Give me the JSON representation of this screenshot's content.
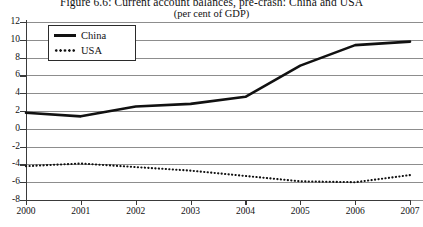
{
  "figure": {
    "title": "Figure 6.6: Current account balances, pre-crash: China and USA",
    "subtitle": "(per cent of GDP)"
  },
  "legend": {
    "items": [
      {
        "label": "China",
        "style": "solid",
        "color": "#111111",
        "swatch_icon": "solid-line-swatch"
      },
      {
        "label": "USA",
        "style": "dotted",
        "color": "#111111",
        "swatch_icon": "dotted-line-swatch"
      }
    ]
  },
  "axes": {
    "y_ticks": [
      "12",
      "10",
      "8",
      "6",
      "4",
      "2",
      "0",
      "-2",
      "-4",
      "-6",
      "-8"
    ],
    "x_ticks": [
      "2000",
      "2001",
      "2002",
      "2003",
      "2004",
      "2005",
      "2006",
      "2007"
    ]
  },
  "chart_data": {
    "type": "line",
    "title": "Figure 6.6: Current account balances, pre-crash: China and USA",
    "subtitle": "(per cent of GDP)",
    "xlabel": "",
    "ylabel": "",
    "x": [
      2000,
      2001,
      2002,
      2003,
      2004,
      2005,
      2006,
      2007
    ],
    "categories": [
      "2000",
      "2001",
      "2002",
      "2003",
      "2004",
      "2005",
      "2006",
      "2007"
    ],
    "series": [
      {
        "name": "China",
        "style": "solid",
        "color": "#111111",
        "values": [
          1.8,
          1.4,
          2.5,
          2.8,
          3.6,
          7.1,
          9.4,
          9.8
        ]
      },
      {
        "name": "USA",
        "style": "dotted",
        "color": "#111111",
        "values": [
          -4.2,
          -3.9,
          -4.3,
          -4.7,
          -5.3,
          -5.9,
          -6.0,
          -5.2
        ]
      }
    ],
    "ylim": [
      -8,
      12
    ],
    "xlim": [
      2000,
      2007
    ],
    "ytick_step": 2,
    "grid": "horizontal",
    "legend_position": "top-left-inside"
  }
}
